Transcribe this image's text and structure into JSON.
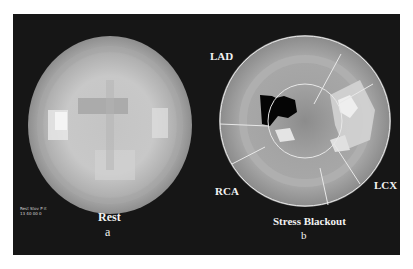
{
  "figure": {
    "left_panel": {
      "title": "Rest",
      "sublabel": "a",
      "info_text_line1": "Rest Stov P it",
      "info_text_line2": "13 40 00 0"
    },
    "right_panel": {
      "title": "Stress Blackout",
      "sublabel": "b",
      "territories": [
        "LAD",
        "LCX",
        "RCA"
      ]
    },
    "colors": {
      "background": "#161616",
      "map_light": "#d8d8d8",
      "map_mid": "#a8a8a8",
      "map_dark": "#8a8a8a",
      "defect": "#050505",
      "overlay_lines": "#e8e8e8"
    }
  }
}
